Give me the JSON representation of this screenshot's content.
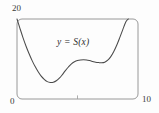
{
  "figure": {
    "background_color": "#fdfdfd",
    "frame_color": "#8d8d8d",
    "curve_color": "#4a4a4a",
    "text_color": "#3a3a3a"
  },
  "labels": {
    "y_max": "20",
    "origin": "0",
    "x_max": "10",
    "curve": "y = S(x)"
  },
  "chart_data": {
    "type": "line",
    "title": "",
    "xlabel": "",
    "ylabel": "",
    "xlim": [
      0,
      10
    ],
    "ylim": [
      0,
      20
    ],
    "grid": false,
    "legend": "none",
    "xticks": [
      0,
      5,
      10
    ],
    "xticklabels": [
      "0",
      "",
      "10"
    ],
    "yticks": [
      0,
      20
    ],
    "yticklabels": [
      "0",
      "20"
    ],
    "annotations": [
      {
        "text": "y = S(x)",
        "x": 4.9,
        "y": 13.4
      }
    ],
    "series": [
      {
        "name": "S(x)",
        "x": [
          0.0,
          0.25,
          0.5,
          0.75,
          1.0,
          1.25,
          1.5,
          1.75,
          2.0,
          2.25,
          2.5,
          2.75,
          3.0,
          3.25,
          3.5,
          3.75,
          4.0,
          4.25,
          4.5,
          4.75,
          5.0,
          5.25,
          5.5,
          5.75,
          6.0,
          6.25,
          6.5,
          6.75,
          7.0,
          7.25,
          7.5,
          7.75,
          8.0,
          8.25,
          8.5,
          8.75,
          9.0,
          9.2
        ],
        "y": [
          20.0,
          17.6,
          15.3,
          13.2,
          11.3,
          9.6,
          8.1,
          6.8,
          5.7,
          4.9,
          4.35,
          4.15,
          4.2,
          4.55,
          5.2,
          6.1,
          7.1,
          8.0,
          8.8,
          9.3,
          9.6,
          9.75,
          9.8,
          9.75,
          9.6,
          9.4,
          9.2,
          9.1,
          9.05,
          9.2,
          9.7,
          10.6,
          11.9,
          13.5,
          15.4,
          17.4,
          19.3,
          20.0
        ]
      }
    ]
  }
}
